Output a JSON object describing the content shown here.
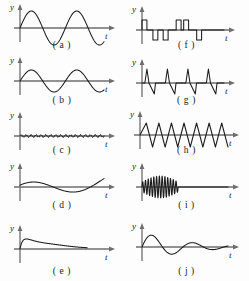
{
  "figure": {
    "background_color": "#fdfdfd",
    "axis_color": "#6e6e6e",
    "curve_color": "#1b1b1b",
    "columns": 2,
    "rows": 5
  },
  "axes": {
    "y_label": "y",
    "t_label": "t"
  },
  "panels": [
    {
      "id": "a",
      "caption": "( a )",
      "name": "sine-wave-large-amplitude",
      "waveform": "sine",
      "description": "Large amplitude low frequency sinusoid, about two cycles",
      "cycles": 1.85,
      "amplitude": 17,
      "phase": 0,
      "box": {
        "x0": 20,
        "y0": 28,
        "x1": 104,
        "width": 84
      }
    },
    {
      "id": "b",
      "caption": "( b )",
      "name": "sine-wave-medium-amplitude",
      "waveform": "sine",
      "description": "Medium amplitude sinusoid, about two cycles",
      "cycles": 1.85,
      "amplitude": 11,
      "phase": 0,
      "box": {
        "x0": 20,
        "y0": 26,
        "x1": 104,
        "width": 84
      }
    },
    {
      "id": "c",
      "caption": "( c )",
      "name": "low-amplitude-ripple",
      "waveform": "ripple",
      "description": "Very small amplitude high frequency ripple along axis",
      "cycles": 17,
      "amplitude": 2,
      "phase": 0,
      "box": {
        "x0": 20,
        "y0": 26,
        "x1": 104,
        "width": 84
      }
    },
    {
      "id": "d",
      "caption": "( d )",
      "name": "slow-drift-wave",
      "waveform": "drift",
      "description": "Single slow oscillation rising at the end",
      "cycles": 1.0,
      "amplitude": 14,
      "phase": 0,
      "box": {
        "x0": 20,
        "y0": 27,
        "x1": 104,
        "width": 84
      }
    },
    {
      "id": "e",
      "caption": "( e )",
      "name": "decaying-transient",
      "waveform": "transient",
      "description": "Positive transient rising to a peak then decaying toward axis",
      "cycles": 0,
      "amplitude": 16,
      "phase": 0,
      "box": {
        "x0": 20,
        "y0": 34,
        "x1": 104,
        "width": 84
      }
    },
    {
      "id": "f",
      "caption": "( f )",
      "name": "binary-pulse-train",
      "waveform": "pulses",
      "description": "Rectangular binary pulse train with positive and negative pulses",
      "pulse_sequence": [
        1,
        -1,
        -1,
        1,
        1,
        -1
      ],
      "pulse_height": 10,
      "box": {
        "x0": 18,
        "y0": 30,
        "x1": 100,
        "width": 82
      }
    },
    {
      "id": "g",
      "caption": "( g )",
      "name": "spike-impulse-train",
      "waveform": "spikes",
      "description": "Sharp narrow spikes upward followed by sawtooth drop below axis",
      "spike_count": 4,
      "spike_height": 14,
      "undershoot": 11,
      "box": {
        "x0": 18,
        "y0": 28,
        "x1": 100,
        "width": 82
      }
    },
    {
      "id": "h",
      "caption": "( h )",
      "name": "triangular-zigzag-wave",
      "waveform": "triangle",
      "description": "Continuous triangular zigzag wave of constant amplitude",
      "cycles": 7,
      "amplitude": 12,
      "box": {
        "x0": 16,
        "y0": 25,
        "x1": 104,
        "width": 88
      }
    },
    {
      "id": "i",
      "caption": "( i )",
      "name": "high-frequency-burst",
      "waveform": "burst",
      "description": "Short high frequency oscillation burst near the origin then flat",
      "cycles": 13,
      "amplitude": 11,
      "burst_fraction": 0.42,
      "box": {
        "x0": 18,
        "y0": 27,
        "x1": 104,
        "width": 86
      }
    },
    {
      "id": "j",
      "caption": "( j )",
      "name": "damped-sinusoid",
      "waveform": "damped",
      "description": "Damped sinusoid with decreasing amplitude over two cycles",
      "cycles": 2.1,
      "amplitude": 15,
      "damping": 0.42,
      "box": {
        "x0": 18,
        "y0": 32,
        "x1": 104,
        "width": 86
      }
    }
  ]
}
